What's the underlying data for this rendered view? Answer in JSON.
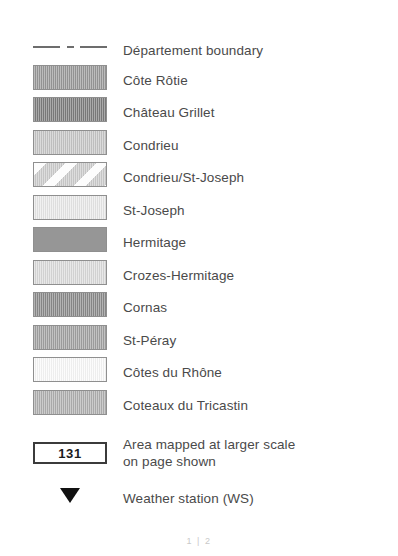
{
  "legend": {
    "swatch_border_color": "#8f8f8f",
    "text_color": "#4a4a4a",
    "rows": [
      {
        "symbol": "dash-dot-line",
        "label": "Département boundary",
        "color": "#6d6d6d",
        "top": 34
      },
      {
        "symbol": "swatch",
        "label": "Côte Rôtie",
        "color": "#9a9a9a",
        "pattern": "vertical-hatch",
        "top": 64
      },
      {
        "symbol": "swatch",
        "label": "Château Grillet",
        "color": "#7e7e7e",
        "pattern": "vertical-hatch",
        "top": 96
      },
      {
        "symbol": "swatch",
        "label": "Condrieu",
        "color": "#c8c8c8",
        "pattern": "vertical-hatch",
        "top": 129
      },
      {
        "symbol": "swatch",
        "label": "Condrieu/St-Joseph",
        "color": "#cfcfcf",
        "pattern": "diagonal-bands",
        "top": 161
      },
      {
        "symbol": "swatch",
        "label": "St-Joseph",
        "color": "#eaeaea",
        "pattern": "vertical-hatch",
        "top": 194
      },
      {
        "symbol": "swatch",
        "label": "Hermitage",
        "color": "#969696",
        "pattern": "solid",
        "top": 226
      },
      {
        "symbol": "swatch",
        "label": "Crozes-Hermitage",
        "color": "#dcdcdc",
        "pattern": "vertical-hatch",
        "top": 259
      },
      {
        "symbol": "swatch",
        "label": "Cornas",
        "color": "#8c8c8c",
        "pattern": "vertical-hatch",
        "top": 291
      },
      {
        "symbol": "swatch",
        "label": "St-Péray",
        "color": "#a3a3a3",
        "pattern": "vertical-hatch",
        "top": 324
      },
      {
        "symbol": "swatch",
        "label": "Côtes du Rhône",
        "color": "#fafafa",
        "pattern": "vertical-hatch",
        "top": 356
      },
      {
        "symbol": "swatch",
        "label": "Coteaux du Tricastin",
        "color": "#b2b2b2",
        "pattern": "vertical-hatch",
        "top": 389
      },
      {
        "symbol": "page-box",
        "box_value": "131",
        "label": "Area mapped at larger scale\non page shown",
        "color": "#3b3b3b",
        "top": 434
      },
      {
        "symbol": "triangle-down",
        "label": "Weather station (WS)",
        "color": "#111111",
        "top": 482
      }
    ]
  },
  "footer": {
    "page_marker": "1 | 2"
  }
}
